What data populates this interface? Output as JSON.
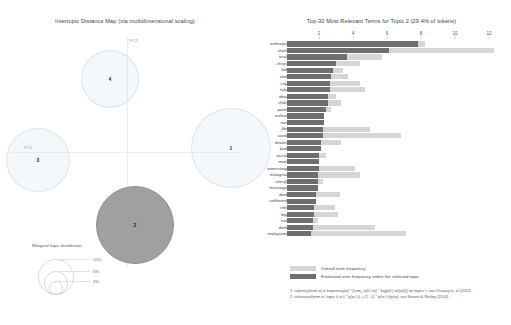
{
  "left_panel": {
    "title": "Intertopic Distance Map (via multidimensional scaling)",
    "axis_labels": {
      "x": "PC1",
      "y": "PC2"
    },
    "topics": [
      {
        "id": "1",
        "label": "1",
        "x": 231,
        "y": 148,
        "r": 40,
        "selected": false
      },
      {
        "id": "2",
        "label": "2",
        "x": 135,
        "y": 225,
        "r": 39,
        "selected": true
      },
      {
        "id": "3",
        "label": "3",
        "x": 38,
        "y": 160,
        "r": 32,
        "selected": false
      },
      {
        "id": "4",
        "label": "4",
        "x": 110,
        "y": 79,
        "r": 29,
        "selected": false
      }
    ],
    "legend": {
      "title": "Marginal topic distribution",
      "entries": [
        {
          "pct": "2%",
          "r": 7
        },
        {
          "pct": "5%",
          "r": 12
        },
        {
          "pct": "10%",
          "r": 18
        }
      ]
    }
  },
  "right_panel": {
    "title": "Top-30 Most Relevant Terms for Topic 2 (29.4% of tokens)",
    "legend": {
      "overall_label": "Overall term frequency",
      "topic_label": "Estimated term frequency within the selected topic"
    },
    "footnotes": [
      "1. saliency(term w) = frequency(w) * [sum_t p(t | w) * log(p(t | w)/p(t))] for topics t; see Chuang et. al (2012)",
      "2. relevance(term w | topic t) = λ * p(w | t) + (1 - λ) * p(w | t)/p(w); see Sievert & Shirley (2014)"
    ]
  },
  "chart_data": {
    "type": "bar",
    "title": "Top-30 Most Relevant Terms for Topic 2 (29.4% of tokens)",
    "xlabel": "",
    "ylabel": "",
    "xlim": [
      0,
      13
    ],
    "xticks": [
      2,
      4,
      6,
      8,
      10,
      12
    ],
    "grid": false,
    "legend_position": "bottom",
    "orientation": "horizontal",
    "categories": [
      "anthropo",
      "short",
      "total",
      "chrys",
      "kid",
      "and",
      "city",
      "tale",
      "idea",
      "chile",
      "point",
      "author",
      "nor",
      "life",
      "used",
      "dealer",
      "bad",
      "oscar",
      "matt",
      "interesting",
      "malaysia",
      "cheryl",
      "message",
      "died",
      "unfiltered",
      "title",
      "big",
      "not",
      "dark",
      "malaysian"
    ],
    "series": [
      {
        "name": "Overall term frequency",
        "values": [
          8.1,
          12.2,
          5.6,
          4.3,
          3.3,
          3.6,
          4.3,
          4.6,
          2.9,
          3.2,
          2.6,
          2.0,
          2.1,
          4.9,
          6.7,
          3.2,
          1.9,
          2.3,
          1.6,
          4.0,
          4.3,
          2.1,
          1.8,
          3.1,
          1.6,
          2.8,
          3.0,
          1.8,
          5.2,
          7.0
        ]
      },
      {
        "name": "Estimated term frequency within the selected topic",
        "values": [
          7.7,
          6.0,
          3.5,
          2.9,
          2.7,
          2.6,
          2.5,
          2.5,
          2.4,
          2.4,
          2.3,
          2.2,
          2.2,
          2.1,
          2.1,
          2.0,
          2.0,
          1.9,
          1.9,
          1.9,
          1.8,
          1.8,
          1.8,
          1.7,
          1.7,
          1.6,
          1.6,
          1.5,
          1.5,
          1.4
        ]
      }
    ],
    "colors": {
      "overall": "#d6d6d6",
      "topic": "#6e6e6e"
    }
  }
}
